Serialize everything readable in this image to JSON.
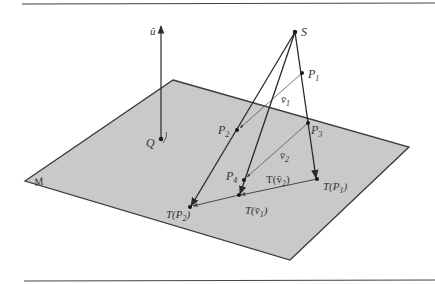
{
  "figure": {
    "colors": {
      "plane_fill": "#c9c9c9",
      "plane_edge": "#3a3a3a",
      "line": "#2a2a2a",
      "thin_line": "#555555",
      "rule": "#444444",
      "background": "#ffffff"
    },
    "plane_label": "M",
    "labels": {
      "u_hat": "û",
      "Q": "Q",
      "S": "S",
      "P1": {
        "main": "P",
        "sub": "1"
      },
      "P2": {
        "main": "P",
        "sub": "2"
      },
      "P3": {
        "main": "P",
        "sub": "3"
      },
      "P4": {
        "main": "P",
        "sub": "4"
      },
      "v1": {
        "main": "v̄",
        "sub": "1"
      },
      "v2": {
        "main": "v̄",
        "sub": "2"
      },
      "TP1": {
        "pre": "T(P",
        "sub": "1",
        "post": ")"
      },
      "TP2": {
        "pre": "T(P",
        "sub": "2",
        "post": ")"
      },
      "Tv1": {
        "pre": "T(v̄",
        "sub": "1",
        "post": ")"
      },
      "Tv2": {
        "pre": "T(v̄",
        "sub": "2",
        "post": ")"
      }
    }
  }
}
